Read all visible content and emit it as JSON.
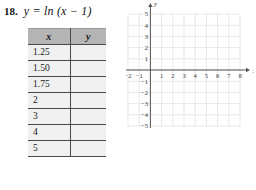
{
  "problem": {
    "number": "18.",
    "equation": "y = ln (x − 1)"
  },
  "table": {
    "headers": [
      "x",
      "y"
    ],
    "rows": [
      {
        "x": "1.25",
        "y": ""
      },
      {
        "x": "1.50",
        "y": ""
      },
      {
        "x": "1.75",
        "y": ""
      },
      {
        "x": "2",
        "y": ""
      },
      {
        "x": "3",
        "y": ""
      },
      {
        "x": "4",
        "y": ""
      },
      {
        "x": "5",
        "y": ""
      }
    ]
  },
  "chart_data": {
    "type": "line",
    "title": "",
    "xlabel": "x",
    "ylabel": "y",
    "xlim": [
      -2,
      8
    ],
    "ylim": [
      -5,
      5
    ],
    "grid": true,
    "legend": "none",
    "x_ticks": [
      "-2",
      "-1",
      "1",
      "2",
      "3",
      "4",
      "5",
      "6",
      "7",
      "8"
    ],
    "y_ticks": [
      "5",
      "4",
      "3",
      "2",
      "1",
      "-1",
      "-2",
      "-3",
      "-4",
      "-5"
    ],
    "series": [
      {
        "name": "y = ln (x - 1)",
        "x": [],
        "values": []
      }
    ],
    "annotations": []
  },
  "colors": {
    "grid": "#d6d6de",
    "axis": "#555555",
    "table_header_bg": "#b4b4b4",
    "table_cell_bg": "#f0f0f0",
    "table_border": "#4a4a4a",
    "text": "#111111"
  }
}
